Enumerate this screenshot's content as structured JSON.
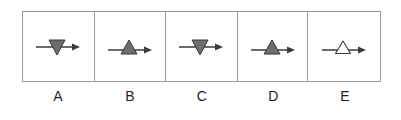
{
  "figure": {
    "kind": "multiple-choice-option-strip",
    "option_count": 5,
    "background_color": "#ffffff",
    "border_color": "#9a9a9a",
    "label_color": "#1d1d1d",
    "triangle_fill_color": "#6e6e6e",
    "triangle_stroke_color": "#3a3a3a",
    "triangle_empty_fill_color": "#ffffff",
    "arrow_color": "#3a3a3a"
  },
  "options": [
    {
      "label": "A",
      "triangle_direction": "down",
      "triangle_filled": true,
      "triangle_fill": "#6e6e6e",
      "arrow_direction": "right",
      "description": "filled gray downward triangle with rightward arrow through it"
    },
    {
      "label": "B",
      "triangle_direction": "up",
      "triangle_filled": true,
      "triangle_fill": "#6e6e6e",
      "arrow_direction": "right",
      "description": "filled gray upward triangle with rightward arrow through it"
    },
    {
      "label": "C",
      "triangle_direction": "down",
      "triangle_filled": true,
      "triangle_fill": "#6e6e6e",
      "arrow_direction": "right",
      "description": "filled gray downward triangle with rightward arrow through it"
    },
    {
      "label": "D",
      "triangle_direction": "up",
      "triangle_filled": true,
      "triangle_fill": "#6e6e6e",
      "arrow_direction": "right",
      "description": "filled gray upward triangle with rightward arrow through it"
    },
    {
      "label": "E",
      "triangle_direction": "up",
      "triangle_filled": false,
      "triangle_fill": "#ffffff",
      "arrow_direction": "right",
      "description": "unfilled white outlined upward triangle with rightward arrow through it"
    }
  ]
}
